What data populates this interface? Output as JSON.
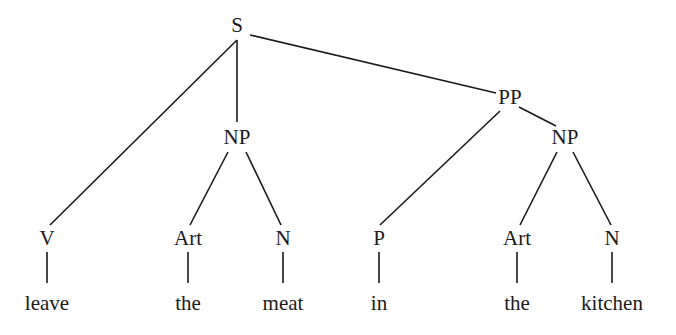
{
  "diagram": {
    "type": "syntax-tree",
    "line_color": "#1a1a1a",
    "nodes": [
      {
        "id": "S",
        "label": "S",
        "x": 237,
        "y": 25
      },
      {
        "id": "NP1",
        "label": "NP",
        "x": 237,
        "y": 137
      },
      {
        "id": "PP",
        "label": "PP",
        "x": 510,
        "y": 97
      },
      {
        "id": "NP2",
        "label": "NP",
        "x": 565,
        "y": 137
      },
      {
        "id": "V",
        "label": "V",
        "x": 47,
        "y": 238
      },
      {
        "id": "Art1",
        "label": "Art",
        "x": 188,
        "y": 238
      },
      {
        "id": "N1",
        "label": "N",
        "x": 283,
        "y": 238
      },
      {
        "id": "P",
        "label": "P",
        "x": 379,
        "y": 238
      },
      {
        "id": "Art2",
        "label": "Art",
        "x": 517,
        "y": 238
      },
      {
        "id": "N2",
        "label": "N",
        "x": 612,
        "y": 238
      },
      {
        "id": "w1",
        "label": "leave",
        "x": 47,
        "y": 303
      },
      {
        "id": "w2",
        "label": "the",
        "x": 188,
        "y": 303
      },
      {
        "id": "w3",
        "label": "meat",
        "x": 283,
        "y": 303
      },
      {
        "id": "w4",
        "label": "in",
        "x": 379,
        "y": 303
      },
      {
        "id": "w5",
        "label": "the",
        "x": 517,
        "y": 303
      },
      {
        "id": "w6",
        "label": "kitchen",
        "x": 612,
        "y": 303
      }
    ],
    "edges": [
      [
        237,
        40,
        50,
        225
      ],
      [
        237,
        40,
        237,
        122
      ],
      [
        250,
        35,
        496,
        93
      ],
      [
        228,
        152,
        190,
        225
      ],
      [
        246,
        152,
        281,
        225
      ],
      [
        500,
        111,
        380,
        225
      ],
      [
        519,
        107,
        556,
        126
      ],
      [
        557,
        152,
        520,
        225
      ],
      [
        573,
        152,
        611,
        225
      ],
      [
        47,
        252,
        47,
        283
      ],
      [
        188,
        252,
        188,
        283
      ],
      [
        283,
        252,
        283,
        283
      ],
      [
        379,
        252,
        379,
        283
      ],
      [
        517,
        252,
        517,
        283
      ],
      [
        612,
        252,
        612,
        283
      ]
    ]
  }
}
